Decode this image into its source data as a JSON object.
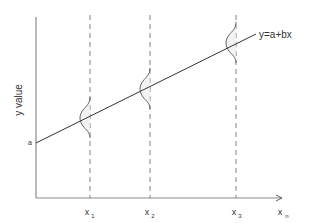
{
  "diagram": {
    "type": "regression-line-with-conditional-distributions",
    "line_equation": "y=a+bx",
    "intercept_label": "a",
    "y_axis_label": "y value",
    "x_labels": [
      {
        "base": "x",
        "sub": "1"
      },
      {
        "base": "x",
        "sub": "2"
      },
      {
        "base": "x",
        "sub": "3"
      },
      {
        "base": "x",
        "sub": "n"
      }
    ],
    "colors": {
      "axis": "#8a8a8a",
      "line": "#333333",
      "dashed": "#777777",
      "curve": "#555555",
      "curve_fill": "#eeeeee",
      "text": "#333333"
    }
  }
}
